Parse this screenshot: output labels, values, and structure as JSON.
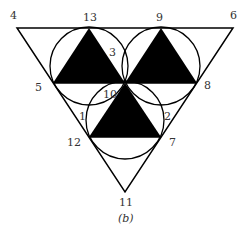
{
  "diagram": {
    "caption": "(b)",
    "outer_triangle": {
      "vertices": [
        "4",
        "6",
        "11"
      ]
    },
    "labels": {
      "p1": "1",
      "p2": "2",
      "p3": "3",
      "p4": "4",
      "p5": "5",
      "p6": "6",
      "p7": "7",
      "p8": "8",
      "p9": "9",
      "p10": "10",
      "p11": "11",
      "p12": "12",
      "p13": "13"
    },
    "filled_triangles": [
      {
        "vertices": [
          "13",
          "5",
          "10"
        ],
        "fill": "#000000"
      },
      {
        "vertices": [
          "9",
          "10",
          "8"
        ],
        "fill": "#000000"
      },
      {
        "vertices": [
          "10",
          "12",
          "7"
        ],
        "fill": "#000000"
      }
    ],
    "circles": [
      {
        "through": [
          "13",
          "5",
          "10"
        ]
      },
      {
        "through": [
          "9",
          "10",
          "8"
        ]
      },
      {
        "through": [
          "10",
          "12",
          "7"
        ]
      }
    ],
    "colors": {
      "stroke": "#000000",
      "fill": "#000000",
      "background": "#ffffff"
    }
  }
}
